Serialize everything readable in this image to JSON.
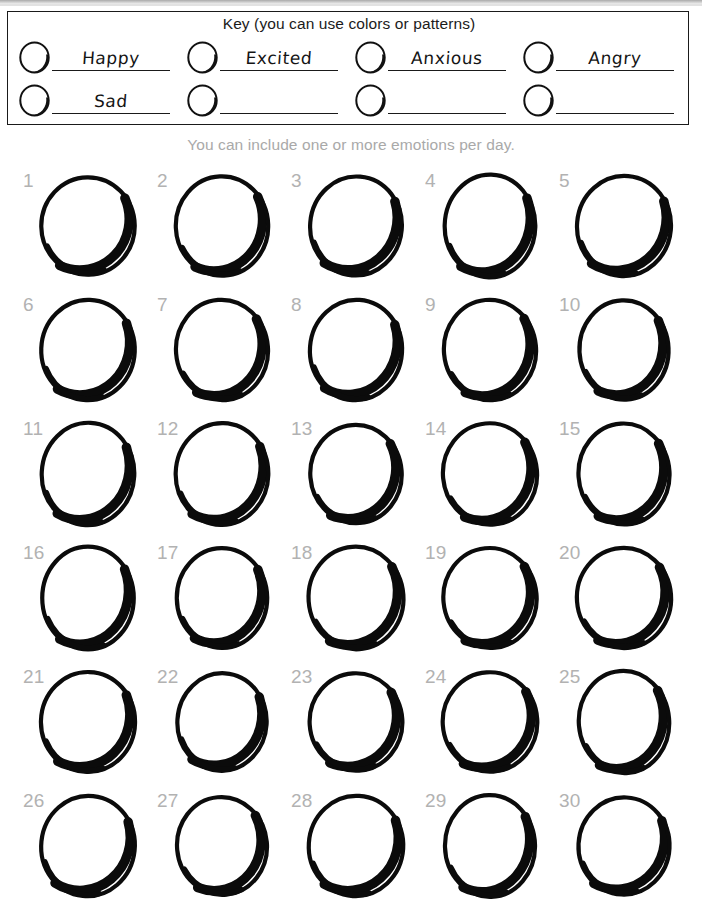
{
  "worksheet": {
    "key": {
      "title": "Key (you can use colors or patterns)",
      "rows": [
        [
          {
            "label": "Happy",
            "filled": true
          },
          {
            "label": "Excited",
            "filled": true
          },
          {
            "label": "Anxious",
            "filled": true
          },
          {
            "label": "Angry",
            "filled": true
          }
        ],
        [
          {
            "label": "Sad",
            "filled": true
          },
          {
            "label": "",
            "filled": false
          },
          {
            "label": "",
            "filled": false
          },
          {
            "label": "",
            "filled": false
          }
        ]
      ]
    },
    "subtitle": "You can include one or more emotions per day.",
    "grid": {
      "columns": 5,
      "rows": 6,
      "days": [
        "1",
        "2",
        "3",
        "4",
        "5",
        "6",
        "7",
        "8",
        "9",
        "10",
        "11",
        "12",
        "13",
        "14",
        "15",
        "16",
        "17",
        "18",
        "19",
        "20",
        "21",
        "22",
        "23",
        "24",
        "25",
        "26",
        "27",
        "28",
        "29",
        "30"
      ]
    },
    "colors": {
      "ink": "#1a1a1a",
      "day_number": "#b2b2b2",
      "subtitle": "#a9a9a9",
      "paper": "#ffffff"
    }
  }
}
